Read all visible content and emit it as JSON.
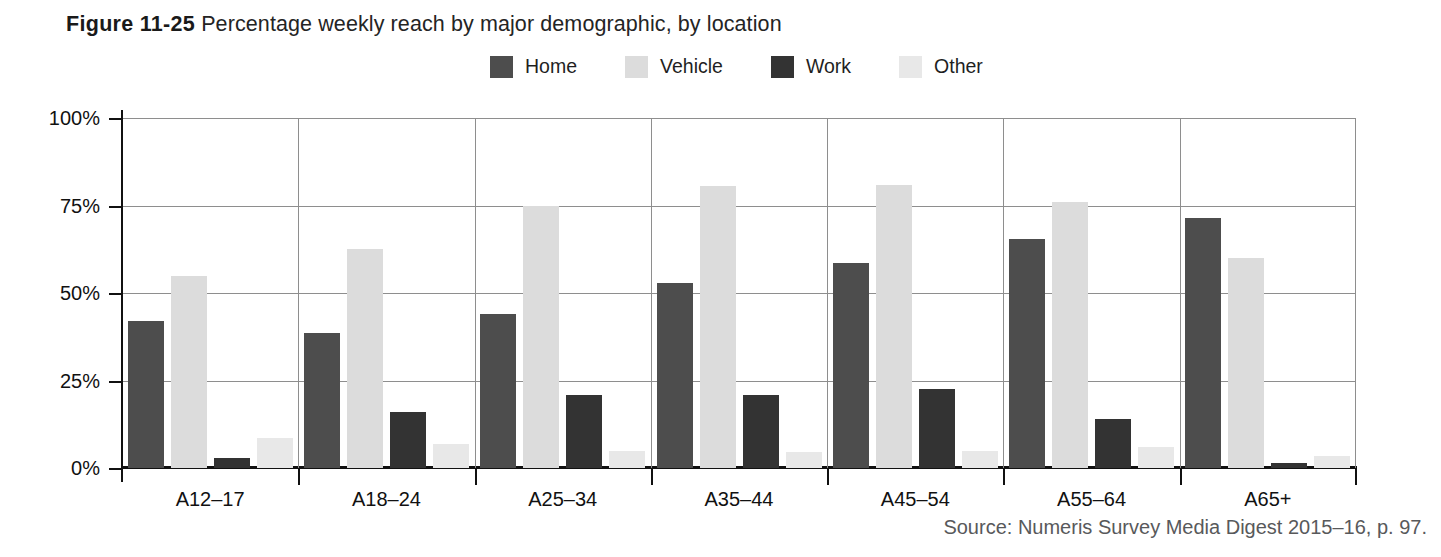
{
  "figure": {
    "number": "Figure 11-25",
    "caption": "Percentage weekly reach by major demographic, by location"
  },
  "source": {
    "text": "Source: Numeris Survey Media Digest 2015–16, p. 97."
  },
  "colors": {
    "home": "#4d4d4d",
    "vehicle": "#dcdcdc",
    "work": "#333333",
    "other": "#e8e8e8",
    "grid": "#8e8e8e",
    "axis": "#111111"
  },
  "chart_data": {
    "type": "bar",
    "title": "Percentage weekly reach by major demographic, by location",
    "xlabel": "",
    "ylabel": "",
    "ylim": [
      0,
      100
    ],
    "yticks": [
      "0%",
      "25%",
      "50%",
      "75%",
      "100%"
    ],
    "ytick_values": [
      0,
      25,
      50,
      75,
      100
    ],
    "grid": true,
    "legend_position": "top-center",
    "categories": [
      "A12–17",
      "A18–24",
      "A25–34",
      "A35–44",
      "A45–54",
      "A55–64",
      "A65+"
    ],
    "series": [
      {
        "name": "Home",
        "color": "#4d4d4d",
        "values": [
          42,
          38.5,
          44,
          53,
          58.5,
          65.5,
          71.5
        ]
      },
      {
        "name": "Vehicle",
        "color": "#dcdcdc",
        "values": [
          55,
          62.5,
          75,
          80.5,
          81,
          76,
          60
        ]
      },
      {
        "name": "Work",
        "color": "#333333",
        "values": [
          3,
          16,
          21,
          21,
          22.5,
          14,
          1.5
        ]
      },
      {
        "name": "Other",
        "color": "#e8e8e8",
        "values": [
          8.5,
          7,
          5,
          4.5,
          5,
          6,
          3.5
        ]
      }
    ]
  }
}
